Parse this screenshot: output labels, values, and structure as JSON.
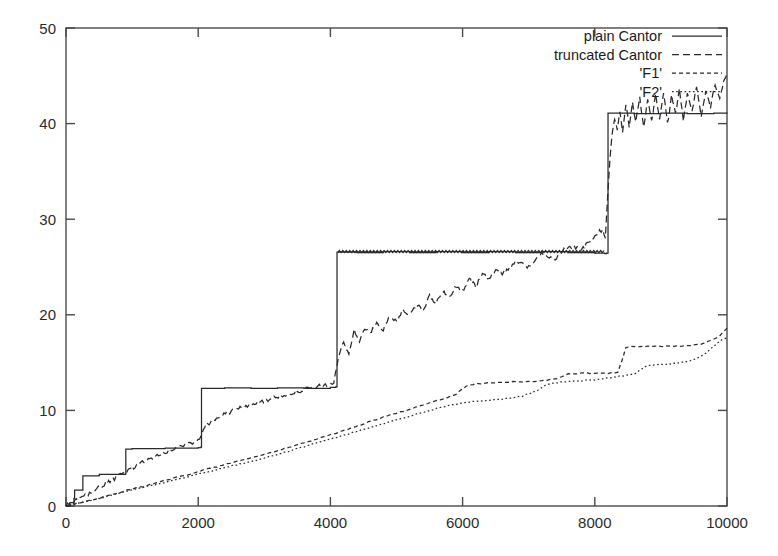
{
  "chart_data": {
    "type": "line",
    "title": "",
    "xlabel": "",
    "ylabel": "",
    "xlim": [
      0,
      10000
    ],
    "ylim": [
      0,
      50
    ],
    "grid": false,
    "legend_position": "top-right",
    "xticks": [
      0,
      2000,
      4000,
      6000,
      8000,
      10000
    ],
    "yticks": [
      0,
      10,
      20,
      30,
      40,
      50
    ],
    "xtick_labels": [
      "0",
      "2000",
      "4000",
      "6000",
      "8000",
      "10000"
    ],
    "ytick_labels": [
      "0",
      "10",
      "20",
      "30",
      "40",
      "50"
    ],
    "series": [
      {
        "name": "plain Cantor",
        "style": "solid",
        "description": "devil's staircase: flat plateaus with sharp doubling jumps",
        "points": [
          [
            0,
            0.0
          ],
          [
            60,
            0.35
          ],
          [
            120,
            0.8
          ],
          [
            130,
            1.65
          ],
          [
            250,
            1.68
          ],
          [
            255,
            3.15
          ],
          [
            500,
            3.2
          ],
          [
            505,
            3.3
          ],
          [
            900,
            3.35
          ],
          [
            905,
            5.95
          ],
          [
            1000,
            6.0
          ],
          [
            1500,
            6.05
          ],
          [
            2000,
            6.1
          ],
          [
            2040,
            6.15
          ],
          [
            2050,
            12.3
          ],
          [
            2400,
            12.35
          ],
          [
            2800,
            12.3
          ],
          [
            3200,
            12.35
          ],
          [
            3600,
            12.3
          ],
          [
            4000,
            12.4
          ],
          [
            4080,
            12.45
          ],
          [
            4100,
            26.55
          ],
          [
            4400,
            26.5
          ],
          [
            4800,
            26.6
          ],
          [
            5200,
            26.5
          ],
          [
            5600,
            26.6
          ],
          [
            6000,
            26.5
          ],
          [
            6400,
            26.6
          ],
          [
            6800,
            26.5
          ],
          [
            7200,
            26.6
          ],
          [
            7600,
            26.5
          ],
          [
            8000,
            26.45
          ],
          [
            8150,
            26.4
          ],
          [
            8180,
            26.45
          ],
          [
            8200,
            41.1
          ],
          [
            8600,
            41.05
          ],
          [
            9000,
            41.1
          ],
          [
            9400,
            41.05
          ],
          [
            9800,
            41.1
          ],
          [
            10000,
            41.05
          ]
        ]
      },
      {
        "name": "truncated Cantor",
        "style": "dashed",
        "description": "noisy rising curve, steep after x=4100, strong oscillation after x=8200",
        "points": [
          [
            0,
            0.0
          ],
          [
            200,
            0.7
          ],
          [
            400,
            1.5
          ],
          [
            600,
            2.3
          ],
          [
            800,
            3.1
          ],
          [
            1000,
            4.0
          ],
          [
            1200,
            4.7
          ],
          [
            1400,
            5.3
          ],
          [
            1600,
            5.9
          ],
          [
            1800,
            6.4
          ],
          [
            2000,
            6.9
          ],
          [
            2100,
            8.4
          ],
          [
            2300,
            9.3
          ],
          [
            2500,
            9.9
          ],
          [
            2700,
            10.4
          ],
          [
            2900,
            10.8
          ],
          [
            3100,
            11.2
          ],
          [
            3300,
            11.6
          ],
          [
            3500,
            12.0
          ],
          [
            3700,
            12.3
          ],
          [
            3900,
            12.6
          ],
          [
            4050,
            12.9
          ],
          [
            4120,
            15.5
          ],
          [
            4200,
            17.1
          ],
          [
            4280,
            16.0
          ],
          [
            4360,
            18.3
          ],
          [
            4440,
            17.3
          ],
          [
            4520,
            18.6
          ],
          [
            4600,
            18.0
          ],
          [
            4700,
            19.1
          ],
          [
            4800,
            18.5
          ],
          [
            4900,
            19.8
          ],
          [
            5000,
            19.2
          ],
          [
            5100,
            20.6
          ],
          [
            5200,
            19.9
          ],
          [
            5300,
            21.2
          ],
          [
            5400,
            20.5
          ],
          [
            5500,
            21.9
          ],
          [
            5600,
            21.2
          ],
          [
            5700,
            22.5
          ],
          [
            5800,
            21.8
          ],
          [
            5900,
            23.1
          ],
          [
            6000,
            22.4
          ],
          [
            6100,
            23.7
          ],
          [
            6200,
            23.0
          ],
          [
            6300,
            24.3
          ],
          [
            6400,
            23.6
          ],
          [
            6500,
            24.9
          ],
          [
            6600,
            24.2
          ],
          [
            6800,
            25.6
          ],
          [
            7000,
            25.0
          ],
          [
            7200,
            26.4
          ],
          [
            7400,
            25.9
          ],
          [
            7600,
            27.2
          ],
          [
            7800,
            26.8
          ],
          [
            8000,
            28.2
          ],
          [
            8120,
            29.0
          ],
          [
            8160,
            27.9
          ],
          [
            8200,
            33.0
          ],
          [
            8230,
            36.5
          ],
          [
            8260,
            38.7
          ],
          [
            8300,
            40.6
          ],
          [
            8340,
            39.2
          ],
          [
            8380,
            41.4
          ],
          [
            8420,
            39.0
          ],
          [
            8470,
            42.0
          ],
          [
            8520,
            39.8
          ],
          [
            8570,
            42.4
          ],
          [
            8620,
            40.0
          ],
          [
            8680,
            42.8
          ],
          [
            8740,
            39.6
          ],
          [
            8800,
            42.6
          ],
          [
            8860,
            40.2
          ],
          [
            8920,
            43.0
          ],
          [
            8980,
            40.6
          ],
          [
            9040,
            43.2
          ],
          [
            9100,
            39.9
          ],
          [
            9160,
            42.8
          ],
          [
            9220,
            41.0
          ],
          [
            9280,
            43.6
          ],
          [
            9340,
            40.4
          ],
          [
            9400,
            43.0
          ],
          [
            9470,
            41.3
          ],
          [
            9540,
            43.8
          ],
          [
            9610,
            40.9
          ],
          [
            9680,
            43.4
          ],
          [
            9750,
            41.8
          ],
          [
            9820,
            44.2
          ],
          [
            9890,
            42.6
          ],
          [
            9950,
            44.6
          ],
          [
            10000,
            45.2
          ]
        ]
      },
      {
        "name": "'F1'",
        "style": "dashed-fine",
        "description": "slowly rising staircase-like curve, plateaus near 13.8 and 17",
        "points": [
          [
            0,
            0.0
          ],
          [
            300,
            0.5
          ],
          [
            600,
            1.0
          ],
          [
            900,
            1.6
          ],
          [
            1200,
            2.1
          ],
          [
            1500,
            2.7
          ],
          [
            1800,
            3.2
          ],
          [
            2100,
            3.8
          ],
          [
            2400,
            4.3
          ],
          [
            2700,
            4.9
          ],
          [
            3000,
            5.4
          ],
          [
            3300,
            6.0
          ],
          [
            3600,
            6.6
          ],
          [
            3900,
            7.2
          ],
          [
            4200,
            7.9
          ],
          [
            4500,
            8.6
          ],
          [
            4800,
            9.3
          ],
          [
            5100,
            9.9
          ],
          [
            5400,
            10.6
          ],
          [
            5700,
            11.2
          ],
          [
            5900,
            11.7
          ],
          [
            6050,
            12.5
          ],
          [
            6200,
            12.8
          ],
          [
            6500,
            12.9
          ],
          [
            6800,
            13.0
          ],
          [
            7000,
            13.0
          ],
          [
            7200,
            13.1
          ],
          [
            7400,
            13.3
          ],
          [
            7500,
            13.5
          ],
          [
            7600,
            13.8
          ],
          [
            7800,
            13.9
          ],
          [
            8000,
            13.9
          ],
          [
            8200,
            13.9
          ],
          [
            8350,
            14.0
          ],
          [
            8420,
            15.4
          ],
          [
            8470,
            16.6
          ],
          [
            8600,
            16.7
          ],
          [
            8800,
            16.7
          ],
          [
            9000,
            16.7
          ],
          [
            9200,
            16.7
          ],
          [
            9400,
            16.75
          ],
          [
            9600,
            16.9
          ],
          [
            9750,
            17.3
          ],
          [
            9880,
            17.7
          ],
          [
            10000,
            18.6
          ]
        ]
      },
      {
        "name": "'F2'",
        "style": "dotted",
        "description": "slowly rising dotted curve just below F1 most of the range",
        "points": [
          [
            0,
            0.0
          ],
          [
            300,
            0.45
          ],
          [
            600,
            0.95
          ],
          [
            900,
            1.5
          ],
          [
            1200,
            2.0
          ],
          [
            1500,
            2.5
          ],
          [
            1800,
            3.0
          ],
          [
            2100,
            3.5
          ],
          [
            2400,
            4.0
          ],
          [
            2700,
            4.5
          ],
          [
            3000,
            5.0
          ],
          [
            3300,
            5.6
          ],
          [
            3600,
            6.2
          ],
          [
            3900,
            6.8
          ],
          [
            4200,
            7.4
          ],
          [
            4500,
            8.0
          ],
          [
            4800,
            8.6
          ],
          [
            5100,
            9.2
          ],
          [
            5400,
            9.8
          ],
          [
            5700,
            10.4
          ],
          [
            6000,
            10.8
          ],
          [
            6300,
            11.0
          ],
          [
            6600,
            11.2
          ],
          [
            6900,
            11.5
          ],
          [
            7100,
            12.0
          ],
          [
            7250,
            12.6
          ],
          [
            7400,
            12.9
          ],
          [
            7600,
            13.0
          ],
          [
            7800,
            13.1
          ],
          [
            8000,
            13.2
          ],
          [
            8200,
            13.4
          ],
          [
            8400,
            13.6
          ],
          [
            8600,
            13.8
          ],
          [
            8700,
            14.3
          ],
          [
            8800,
            14.7
          ],
          [
            9000,
            14.8
          ],
          [
            9200,
            14.9
          ],
          [
            9400,
            15.1
          ],
          [
            9550,
            15.5
          ],
          [
            9700,
            16.1
          ],
          [
            9820,
            16.8
          ],
          [
            9920,
            17.4
          ],
          [
            10000,
            17.6
          ]
        ]
      }
    ]
  },
  "legend": {
    "entries": [
      {
        "label": "plain Cantor",
        "style": "solid"
      },
      {
        "label": "truncated Cantor",
        "style": "dashed"
      },
      {
        "label": "'F1'",
        "style": "dashed-fine"
      },
      {
        "label": "'F2'",
        "style": "dotted"
      }
    ]
  },
  "colors": {
    "ink": "#2a2a2a",
    "axis": "#4a4a4a",
    "background": "#ffffff"
  }
}
